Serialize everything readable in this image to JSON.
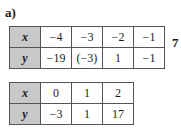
{
  "label": "a)",
  "side_number": "7",
  "table1": {
    "x_header": "x",
    "y_header": "y",
    "x_values": [
      "−4",
      "−3",
      "−2",
      "−1"
    ],
    "y_values": [
      "−19",
      "(−3)",
      "1",
      "−1"
    ]
  },
  "table2": {
    "x_header": "x",
    "y_header": "y",
    "x_values": [
      "0",
      "1",
      "2"
    ],
    "y_values": [
      "−3",
      "1",
      "17"
    ]
  }
}
